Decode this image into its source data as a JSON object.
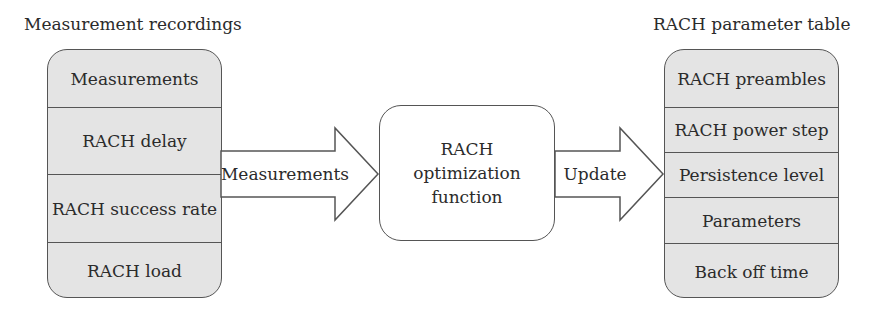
{
  "left_panel": {
    "title": "Measurement recordings",
    "rows": [
      "Measurements",
      "RACH delay",
      "RACH success rate",
      "RACH load"
    ]
  },
  "arrows": {
    "input": {
      "label": "Measurements"
    },
    "output": {
      "label": "Update"
    }
  },
  "center_box": {
    "lines": [
      "RACH",
      "optimization",
      "function"
    ]
  },
  "right_panel": {
    "title": "RACH parameter table",
    "rows": [
      "RACH preambles",
      "RACH power step",
      "Persistence level",
      "Parameters",
      "Back off time"
    ]
  },
  "colors": {
    "stack_fill": "#e4e4e4",
    "stroke": "#555555",
    "text": "#2b2b2b"
  }
}
